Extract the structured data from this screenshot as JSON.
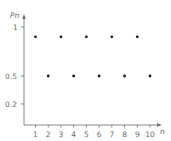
{
  "chart_data": {
    "type": "scatter",
    "title": "",
    "xlabel": "n",
    "ylabel": "Pn",
    "x": [
      1,
      2,
      3,
      4,
      5,
      6,
      7,
      8,
      9,
      10
    ],
    "values": [
      0.9,
      0.5,
      0.9,
      0.5,
      0.9,
      0.5,
      0.9,
      0.5,
      0.9,
      0.5
    ],
    "series": [
      {
        "name": "Pn",
        "x": [
          1,
          2,
          3,
          4,
          5,
          6,
          7,
          8,
          9,
          10
        ],
        "values": [
          0.9,
          0.5,
          0.9,
          0.5,
          0.9,
          0.5,
          0.9,
          0.5,
          0.9,
          0.5
        ]
      }
    ],
    "xticks": [
      "1",
      "2",
      "3",
      "4",
      "5",
      "6",
      "7",
      "8",
      "9",
      "10"
    ],
    "yticks": [
      "0.2",
      "0.5",
      "1"
    ],
    "ylim": [
      0,
      1.05
    ],
    "xlim": [
      0,
      10.5
    ],
    "grid": false,
    "legend": null
  },
  "labels": {
    "ylabel": "Pn",
    "xlabel": "n",
    "ytick_1": "1",
    "ytick_05": "0.5",
    "ytick_02": "0.2",
    "xticks": [
      "1",
      "2",
      "3",
      "4",
      "5",
      "6",
      "7",
      "8",
      "9",
      "10"
    ]
  }
}
